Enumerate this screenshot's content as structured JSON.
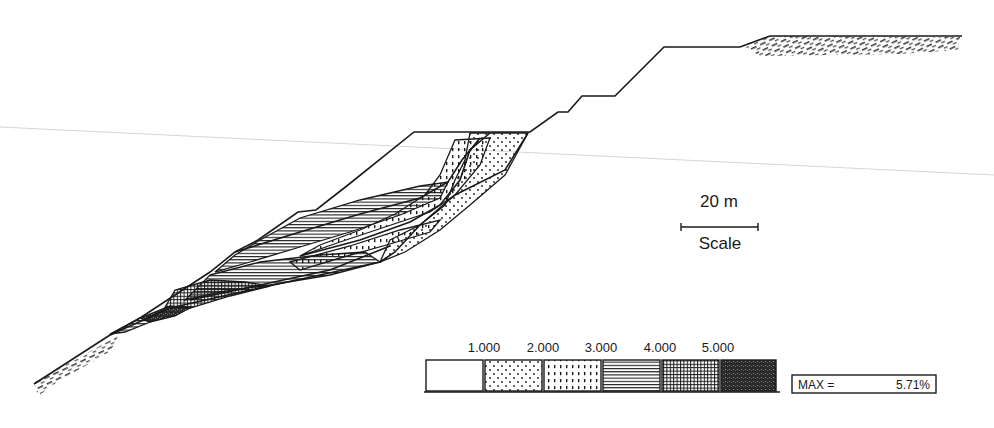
{
  "figure": {
    "type": "slope cross-section with contour zones",
    "scale": {
      "label": "20 m",
      "caption": "Scale"
    },
    "legend": {
      "ticks": [
        "1.000",
        "2.000",
        "3.000",
        "4.000",
        "5.000"
      ],
      "swatches": [
        {
          "range": "< 1.000",
          "pattern": "blank"
        },
        {
          "range": "1.000 - 2.000",
          "pattern": "sparse-dots"
        },
        {
          "range": "2.000 - 3.000",
          "pattern": "vertical-dashes"
        },
        {
          "range": "3.000 - 4.000",
          "pattern": "horizontal-lines"
        },
        {
          "range": "4.000 - 5.000",
          "pattern": "cross-hatch"
        },
        {
          "range": "> 5.000",
          "pattern": "dense-dark"
        }
      ],
      "max_label": "MAX =",
      "max_value": "5.71%"
    },
    "colors": {
      "ink": "#1a1a1a",
      "paper": "#ffffff",
      "scan_line": "#d0d0d0"
    }
  }
}
